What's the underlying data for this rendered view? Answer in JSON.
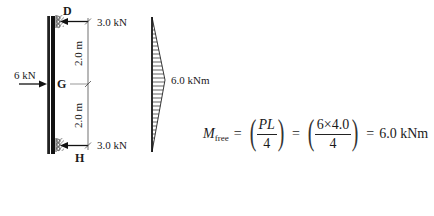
{
  "diagram": {
    "column": {
      "top_node": "D",
      "mid_node": "G",
      "bottom_node": "H",
      "top_reaction": "3.0 kN",
      "bottom_reaction": "3.0 kN",
      "applied_load": "6 kN",
      "segment_top_length": "2.0 m",
      "segment_bottom_length": "2.0 m"
    },
    "moment_diagram": {
      "peak_label": "6.0 kNm",
      "shape": "triangle",
      "peak_position": "mid-height"
    },
    "equation": {
      "lhs_symbol": "M",
      "lhs_subscript": "free",
      "equals": "=",
      "frac1_num": "PL",
      "frac1_den": "4",
      "frac2_num": "6×4.0",
      "frac2_den": "4",
      "result": "6.0 kNm",
      "paren_open": "(",
      "paren_close": ")"
    },
    "colors": {
      "ink": "#1a1a1a",
      "background": "#ffffff"
    }
  }
}
